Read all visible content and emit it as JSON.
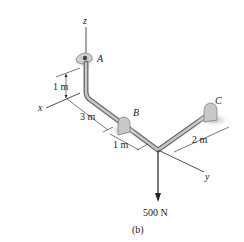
{
  "figure": {
    "caption": "(b)",
    "axes": {
      "x": "x",
      "y": "y",
      "z": "z"
    },
    "points": {
      "A": "A",
      "B": "B",
      "C": "C"
    },
    "dimensions": {
      "vertical": "1 m",
      "segment_ab": "3 m",
      "segment_b_elbow": "1 m",
      "segment_c": "2 m"
    },
    "force": {
      "label": "500 N",
      "direction": "down"
    },
    "colors": {
      "pipe": "#8a8a8a",
      "pipe_highlight": "#d0d0d0",
      "support": "#c8c8c8",
      "shadow": "#bdbdbd",
      "line": "#222222"
    }
  }
}
